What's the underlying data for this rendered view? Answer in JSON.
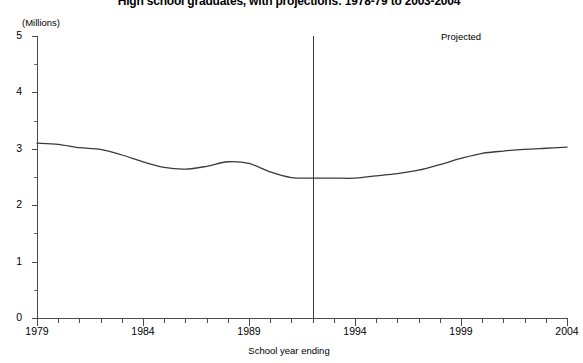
{
  "chart_data": {
    "type": "line",
    "title": "High school graduates, with projections: 1978-79 to 2003-2004",
    "xlabel": "School year ending",
    "ylabel": "(Millions)",
    "ylim": [
      0,
      5
    ],
    "xlim": [
      1979,
      2004
    ],
    "grid": false,
    "legend": null,
    "y_ticks": [
      0,
      1,
      2,
      3,
      4,
      5
    ],
    "y_tick_labels": [
      "0",
      "1",
      "2",
      "3",
      "4",
      "5"
    ],
    "y_minor_ticks": [
      0.5,
      1.5,
      2.5,
      3.5,
      4.5
    ],
    "x_ticks": [
      1979,
      1980,
      1981,
      1982,
      1983,
      1984,
      1985,
      1986,
      1987,
      1988,
      1989,
      1990,
      1991,
      1992,
      1993,
      1994,
      1995,
      1996,
      1997,
      1998,
      1999,
      2000,
      2001,
      2002,
      2003,
      2004
    ],
    "x_tick_labels": [
      {
        "value": 1979,
        "label": "1979"
      },
      {
        "value": 1984,
        "label": "1984"
      },
      {
        "value": 1989,
        "label": "1989"
      },
      {
        "value": 1994,
        "label": "1994"
      },
      {
        "value": 1999,
        "label": "1999"
      },
      {
        "value": 2004,
        "label": "2004"
      }
    ],
    "annotations": [
      {
        "name": "projected-label",
        "text": "Projected",
        "x": 2000.5,
        "y": 4.72
      },
      {
        "name": "projection-divider",
        "type": "vline",
        "x": 1992,
        "y_from": 0,
        "y_to": 5
      }
    ],
    "series": [
      {
        "name": "High school graduates",
        "color": "#3a3a3a",
        "x": [
          1979,
          1980,
          1981,
          1982,
          1983,
          1984,
          1985,
          1986,
          1987,
          1988,
          1989,
          1990,
          1991,
          1992,
          1993,
          1994,
          1995,
          1996,
          1997,
          1998,
          1999,
          2000,
          2001,
          2002,
          2003,
          2004
        ],
        "values": [
          3.1,
          3.08,
          3.02,
          2.99,
          2.89,
          2.77,
          2.67,
          2.64,
          2.69,
          2.77,
          2.74,
          2.59,
          2.49,
          2.48,
          2.48,
          2.48,
          2.52,
          2.56,
          2.62,
          2.72,
          2.83,
          2.92,
          2.96,
          2.99,
          3.01,
          3.03
        ]
      }
    ]
  },
  "axes": {
    "y_unit_label": "(Millions)",
    "x_axis_title": "School year ending"
  }
}
